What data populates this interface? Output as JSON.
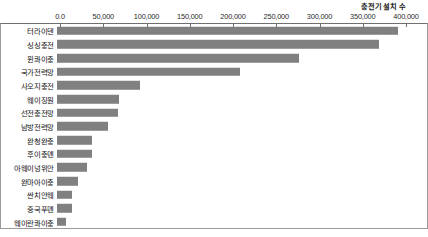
{
  "axis": {
    "title": "충전기 설치 수",
    "tick_labels": [
      "0.0",
      "50,000",
      "100,000",
      "150,000",
      "200,000",
      "250,000",
      "300,000",
      "350,000",
      "400,000"
    ]
  },
  "chart_data": {
    "type": "bar",
    "orientation": "horizontal",
    "title": "",
    "subtitle": "",
    "xlabel": "충전기 설치 수",
    "ylabel": "",
    "xlim": [
      0,
      400000
    ],
    "xticks": [
      0,
      50000,
      100000,
      150000,
      200000,
      250000,
      300000,
      350000,
      400000
    ],
    "xtick_labels": [
      "0.0",
      "50,000",
      "100,000",
      "150,000",
      "200,000",
      "250,000",
      "300,000",
      "350,000",
      "400,000"
    ],
    "axis_position": "top",
    "grid": false,
    "legend": "none",
    "bar_color": "#808080",
    "categories": [
      "터라이덴",
      "싱싱충전",
      "윈콰이충",
      "국가전력망",
      "사오지충전",
      "웨이징원",
      "선전충전망",
      "남방전력망",
      "완청완충",
      "후이충뎬",
      "아웨이넝위안",
      "완마아이충",
      "싼치안웨",
      "중국푸뎬",
      "웨이란콰이충"
    ],
    "values": [
      394000,
      372000,
      280000,
      212000,
      96000,
      72000,
      70000,
      59000,
      41000,
      40000,
      35000,
      24000,
      17000,
      17000,
      10000
    ]
  }
}
